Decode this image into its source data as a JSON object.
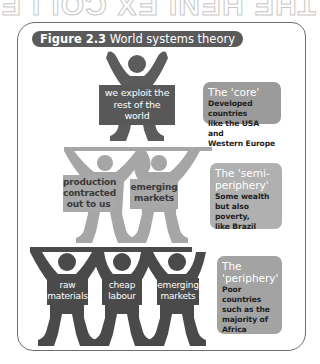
{
  "bleed_text": "THE HENLEX COLLE",
  "figure": {
    "label": "Figure 2.3",
    "title": "World systems theory"
  },
  "tiers": [
    {
      "level": "core",
      "figures": [
        {
          "sign": "we exploit the rest of the world",
          "lines": [
            "we exploit the",
            "rest of the",
            "world"
          ]
        }
      ],
      "legend": {
        "heading": "The 'core'",
        "description": "Developed countries like the USA and Western Europe",
        "desc_lines": [
          "Developed countries",
          "like the USA and",
          "Western Europe"
        ]
      },
      "figure_color": "#5c5c5c"
    },
    {
      "level": "semi-periphery",
      "figures": [
        {
          "sign": "production contracted out to us",
          "lines": [
            "production",
            "contracted",
            "out to us"
          ]
        },
        {
          "sign": "emerging markets",
          "lines": [
            "emerging",
            "markets"
          ]
        }
      ],
      "legend": {
        "heading": "The 'semi-periphery'",
        "heading_lines": [
          "The 'semi-",
          "periphery'"
        ],
        "description": "Some wealth but also poverty, like Brazil",
        "desc_lines": [
          "Some wealth",
          "but also poverty,",
          "like Brazil"
        ]
      },
      "figure_color": "#a6a6a6"
    },
    {
      "level": "periphery",
      "figures": [
        {
          "sign": "raw materials",
          "lines": [
            "raw",
            "materials"
          ]
        },
        {
          "sign": "cheap labour",
          "lines": [
            "cheap",
            "labour"
          ]
        },
        {
          "sign": "emerging markets",
          "lines": [
            "emerging",
            "markets"
          ]
        }
      ],
      "legend": {
        "heading": "The 'periphery'",
        "heading_lines": [
          "The",
          "'periphery'"
        ],
        "description": "Poor countries such as the majority of Africa",
        "desc_lines": [
          "Poor countries",
          "such as the",
          "majority of",
          "Africa"
        ]
      },
      "figure_color": "#4a4a4a"
    }
  ],
  "colors": {
    "frame_border": "#6e6e6e",
    "title_pill": "#5a5a5a",
    "core_figure": "#5c5c5c",
    "semi_figure": "#a6a6a6",
    "periphery_figure": "#4a4a4a"
  }
}
